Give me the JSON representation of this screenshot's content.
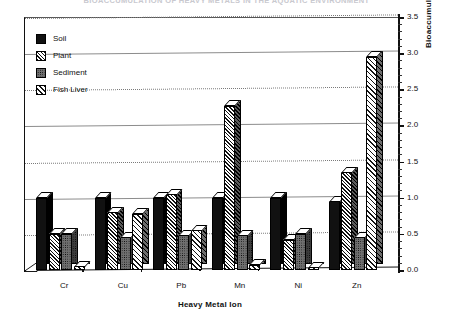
{
  "chart_title": "BIOACCUMULATION OF HEAVY METALS IN THE AQUATIC ENVIRONMENT",
  "axes": {
    "x_title": "Heavy Metal Ion",
    "y_title": "Bioaccumulation  Index",
    "y_ticks": [
      "0.0",
      "0.5",
      "1.0",
      "1.5",
      "2.0",
      "2.5",
      "3.0",
      "3.5"
    ]
  },
  "legend": {
    "items": [
      {
        "label": "Soil",
        "pattern": "solid-black",
        "color": "#111111"
      },
      {
        "label": "Plant",
        "pattern": "diagonal-hatch",
        "color": "#111111"
      },
      {
        "label": "Sediment",
        "pattern": "stipple-gray",
        "color": "#6f6f6f"
      },
      {
        "label": "Fish Liver",
        "pattern": "diagonal-hatch-light",
        "color": "#151515"
      }
    ]
  },
  "chart_data": {
    "type": "bar",
    "title": "BIOACCUMULATION OF HEAVY METALS IN THE AQUATIC ENVIRONMENT",
    "xlabel": "Heavy Metal Ion",
    "ylabel": "Bioaccumulation  Index",
    "ylim": [
      0.0,
      3.5
    ],
    "ytick_step": 0.5,
    "grid": true,
    "legend_position": "top-left-inside",
    "three_d": true,
    "categories": [
      "Cr",
      "Cu",
      "Pb",
      "Mn",
      "Ni",
      "Zn"
    ],
    "series": [
      {
        "name": "Soil",
        "values": [
          1.0,
          1.0,
          1.0,
          1.0,
          1.0,
          0.95
        ]
      },
      {
        "name": "Plant",
        "values": [
          0.5,
          0.8,
          1.05,
          2.27,
          0.42,
          1.35
        ]
      },
      {
        "name": "Sediment",
        "values": [
          0.5,
          0.45,
          0.48,
          0.48,
          0.5,
          0.45
        ]
      },
      {
        "name": "Fish Liver",
        "values": [
          0.05,
          0.78,
          0.55,
          0.07,
          0.04,
          2.95
        ]
      }
    ]
  }
}
